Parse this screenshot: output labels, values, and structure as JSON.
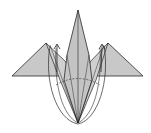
{
  "diagram": {
    "type": "origami-fold-step",
    "colors": {
      "paper_fill": "#c8c8c8",
      "paper_fill_light": "#d4d4d4",
      "line": "#2a2a2a",
      "background": "#ffffff"
    },
    "annotations": [
      {
        "kind": "arrow",
        "direction": "up",
        "side": "left"
      },
      {
        "kind": "arrow",
        "direction": "up",
        "side": "right"
      },
      {
        "kind": "fold-path",
        "shape": "elliptical-loop",
        "side": "left"
      },
      {
        "kind": "fold-path",
        "shape": "elliptical-loop",
        "side": "right"
      },
      {
        "kind": "crease",
        "style": "dashed",
        "shape": "arc"
      }
    ]
  }
}
